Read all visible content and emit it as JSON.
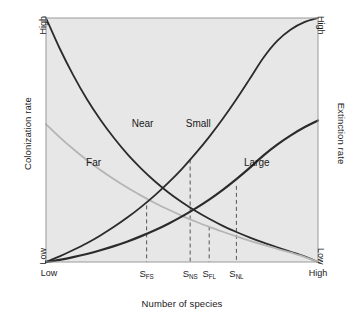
{
  "figure": {
    "title": "",
    "background_color": "#ffffff",
    "plot_background_color": "#e7e7e7",
    "frame_color": "#9a9a9a"
  },
  "axes": {
    "left": {
      "title": "Colonization rate",
      "high_label": "High",
      "low_label": "Low"
    },
    "right": {
      "title": "Extinction rate",
      "high_label": "High",
      "low_label": "Low"
    },
    "bottom": {
      "title": "Number of species",
      "low_label": "Low",
      "high_label": "High"
    }
  },
  "curve_labels": {
    "near": "Near",
    "far": "Far",
    "small": "Small",
    "large": "Large"
  },
  "species_ticks": [
    {
      "id": "s-fs",
      "base": "S",
      "sub": "FS"
    },
    {
      "id": "s-ns",
      "base": "S",
      "sub": "NS"
    },
    {
      "id": "s-fl",
      "base": "S",
      "sub": "FL"
    },
    {
      "id": "s-nl",
      "base": "S",
      "sub": "NL"
    }
  ],
  "chart_data": {
    "type": "line",
    "title": "",
    "xlabel": "Number of species",
    "ylabel": "Colonization rate",
    "y2label": "Extinction rate",
    "xlim": [
      0,
      1
    ],
    "ylim": [
      0,
      1
    ],
    "xtick_labels": [
      "Low",
      "S_FS",
      "S_NS",
      "S_FL",
      "S_NL",
      "High"
    ],
    "xtick_values": [
      0.0,
      0.37,
      0.53,
      0.6,
      0.7,
      1.0
    ],
    "ytick_labels": [
      "Low",
      "High"
    ],
    "ytick_values": [
      0.0,
      1.0
    ],
    "grid": false,
    "legend": "inline-labels",
    "series": [
      {
        "name": "Near",
        "role": "colonization",
        "color": "#2b2b2b",
        "line_width": 1.8,
        "description": "Colonization curve for near island: starts High at low species, decays to Low at high species",
        "x": [
          0.0,
          0.05,
          0.1,
          0.15,
          0.2,
          0.25,
          0.3,
          0.35,
          0.4,
          0.45,
          0.5,
          0.55,
          0.6,
          0.65,
          0.7,
          0.75,
          0.8,
          0.85,
          0.9,
          0.95,
          1.0
        ],
        "y": [
          1.0,
          0.876,
          0.766,
          0.668,
          0.583,
          0.508,
          0.441,
          0.383,
          0.331,
          0.285,
          0.245,
          0.209,
          0.177,
          0.148,
          0.123,
          0.1,
          0.079,
          0.06,
          0.042,
          0.023,
          0.0
        ]
      },
      {
        "name": "Far",
        "role": "colonization",
        "color": "#b5b5b5",
        "line_width": 1.8,
        "description": "Colonization curve for far island: starts at intermediate rate, decays to Low at high species",
        "x": [
          0.0,
          0.05,
          0.1,
          0.15,
          0.2,
          0.25,
          0.3,
          0.35,
          0.4,
          0.45,
          0.5,
          0.55,
          0.6,
          0.65,
          0.7,
          0.75,
          0.8,
          0.85,
          0.9,
          0.95,
          1.0
        ],
        "y": [
          0.565,
          0.512,
          0.463,
          0.418,
          0.377,
          0.339,
          0.304,
          0.272,
          0.242,
          0.215,
          0.189,
          0.166,
          0.144,
          0.124,
          0.105,
          0.087,
          0.07,
          0.054,
          0.038,
          0.021,
          0.0
        ]
      },
      {
        "name": "Small",
        "role": "extinction",
        "color": "#2b2b2b",
        "line_width": 1.8,
        "description": "Extinction curve for small island: rises steeply from Low to High",
        "x": [
          0.0,
          0.05,
          0.1,
          0.15,
          0.2,
          0.25,
          0.3,
          0.35,
          0.4,
          0.45,
          0.5,
          0.55,
          0.6,
          0.65,
          0.7,
          0.75,
          0.8,
          0.85,
          0.9,
          0.95,
          1.0
        ],
        "y": [
          0.0,
          0.023,
          0.049,
          0.077,
          0.109,
          0.144,
          0.183,
          0.226,
          0.273,
          0.325,
          0.382,
          0.445,
          0.513,
          0.587,
          0.667,
          0.752,
          0.838,
          0.906,
          0.953,
          0.983,
          1.0
        ]
      },
      {
        "name": "Large",
        "role": "extinction",
        "color": "#2b2b2b",
        "line_width": 2.2,
        "description": "Extinction curve for large island: rises gently from Low to about 0.58",
        "x": [
          0.0,
          0.05,
          0.1,
          0.15,
          0.2,
          0.25,
          0.3,
          0.35,
          0.4,
          0.45,
          0.5,
          0.55,
          0.6,
          0.65,
          0.7,
          0.75,
          0.8,
          0.85,
          0.9,
          0.95,
          1.0
        ],
        "y": [
          0.0,
          0.009,
          0.02,
          0.033,
          0.048,
          0.065,
          0.084,
          0.106,
          0.13,
          0.157,
          0.187,
          0.22,
          0.256,
          0.296,
          0.34,
          0.387,
          0.437,
          0.481,
          0.519,
          0.552,
          0.58
        ]
      }
    ],
    "equilibria": [
      {
        "label": "S_FS",
        "x": 0.37,
        "y": 0.232,
        "intersection_of": [
          "Far",
          "Small"
        ]
      },
      {
        "label": "S_NS",
        "x": 0.53,
        "y": 0.42,
        "intersection_of": [
          "Near",
          "Small"
        ]
      },
      {
        "label": "S_FL",
        "x": 0.6,
        "y": 0.146,
        "intersection_of": [
          "Far",
          "Large"
        ]
      },
      {
        "label": "S_NL",
        "x": 0.7,
        "y": 0.312,
        "intersection_of": [
          "Near",
          "Large"
        ]
      }
    ],
    "annotations": [
      {
        "text": "Near",
        "x": 0.355,
        "y": 0.555
      },
      {
        "text": "Far",
        "x": 0.175,
        "y": 0.395
      },
      {
        "text": "Small",
        "x": 0.56,
        "y": 0.555
      },
      {
        "text": "Large",
        "x": 0.775,
        "y": 0.395
      }
    ]
  }
}
